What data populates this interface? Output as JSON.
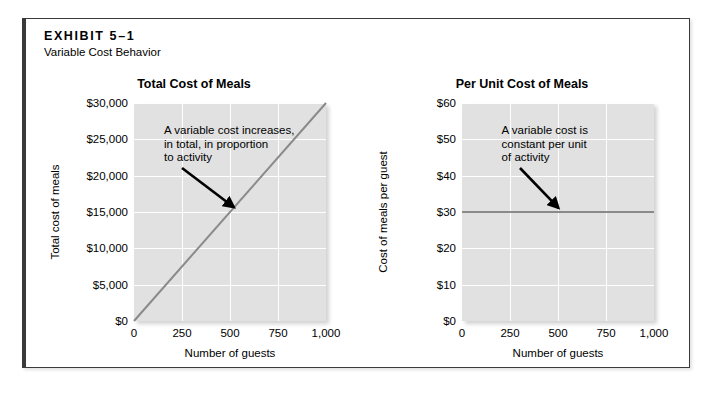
{
  "exhibit": {
    "label": "EXHIBIT 5–1",
    "subtitle": "Variable Cost Behavior"
  },
  "colors": {
    "plot_background": "#e1e1e1",
    "gridline": "#ffffff",
    "data_line": "#8a8a8a",
    "arrow": "#000000",
    "frame_border": "#3a3a3c"
  },
  "chart_data": [
    {
      "id": "total-cost-of-meals",
      "type": "line",
      "title": "Total Cost of Meals",
      "xlabel": "Number of guests",
      "ylabel": "Total cost of meals",
      "xlim": [
        0,
        1000
      ],
      "ylim": [
        0,
        30000
      ],
      "grid": true,
      "legend": "none",
      "xticks": [
        0,
        250,
        500,
        750,
        1000
      ],
      "xticklabels": [
        "0",
        "250",
        "500",
        "750",
        "1,000"
      ],
      "yticks": [
        0,
        5000,
        10000,
        15000,
        20000,
        25000,
        30000
      ],
      "yticklabels": [
        "$0",
        "$5,000",
        "$10,000",
        "$15,000",
        "$20,000",
        "$25,000",
        "$30,000"
      ],
      "series": [
        {
          "name": "Total cost of meals",
          "x": [
            0,
            1000
          ],
          "values": [
            0,
            30000
          ]
        }
      ],
      "annotations": [
        {
          "lines": [
            "A variable cost increases,",
            "in total, in proportion",
            "to activity"
          ],
          "arrow_from": [
            250,
            21000
          ],
          "arrow_to": [
            520,
            15600
          ]
        }
      ]
    },
    {
      "id": "per-unit-cost-of-meals",
      "type": "line",
      "title": "Per Unit Cost of Meals",
      "xlabel": "Number of guests",
      "ylabel": "Cost of meals per guest",
      "xlim": [
        0,
        1000
      ],
      "ylim": [
        0,
        60
      ],
      "grid": true,
      "legend": "none",
      "xticks": [
        0,
        250,
        500,
        750,
        1000
      ],
      "xticklabels": [
        "0",
        "250",
        "500",
        "750",
        "1,000"
      ],
      "yticks": [
        0,
        10,
        20,
        30,
        40,
        50,
        60
      ],
      "yticklabels": [
        "$0",
        "$10",
        "$20",
        "$30",
        "$40",
        "$50",
        "$60"
      ],
      "series": [
        {
          "name": "Cost of meals per guest",
          "x": [
            0,
            1000
          ],
          "values": [
            30,
            30
          ]
        }
      ],
      "annotations": [
        {
          "lines": [
            "A variable cost is",
            "constant per unit",
            "of activity"
          ],
          "arrow_from": [
            300,
            42
          ],
          "arrow_to": [
            500,
            31
          ]
        }
      ]
    }
  ]
}
